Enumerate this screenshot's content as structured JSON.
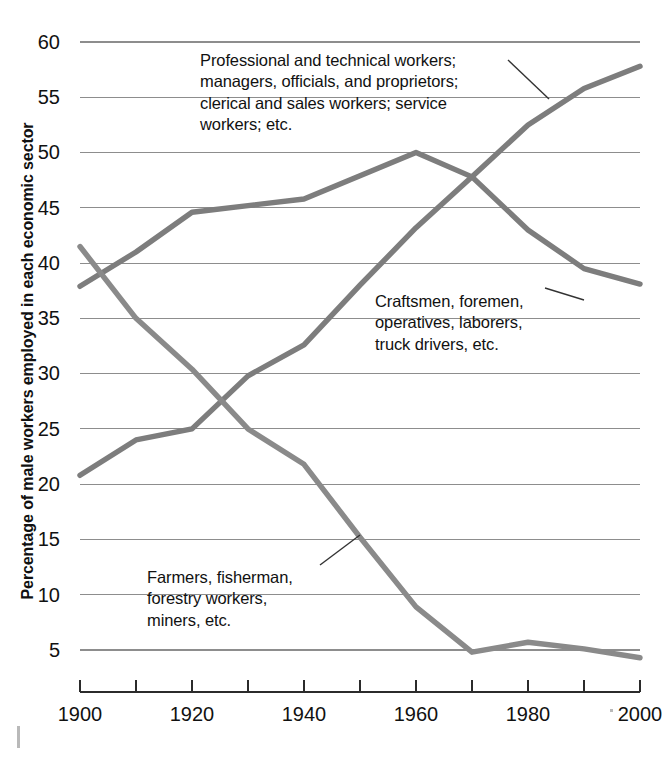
{
  "chart_data": {
    "type": "line",
    "title": "",
    "subtitle": "",
    "xlabel": "",
    "ylabel": "Percentage of male workers employed in each economic sector",
    "xlim": [
      1900,
      2000
    ],
    "ylim": [
      0,
      60
    ],
    "grid": true,
    "legend_position": "inline-annotations",
    "x": [
      1900,
      1910,
      1920,
      1930,
      1940,
      1950,
      1960,
      1970,
      1980,
      1990,
      2000
    ],
    "x_tick_labels": [
      "1900",
      "1920",
      "1940",
      "1960",
      "1980",
      "2000"
    ],
    "x_tick_values": [
      1900,
      1920,
      1940,
      1960,
      1980,
      2000
    ],
    "x_minor_tick_values": [
      1910,
      1930,
      1950,
      1970,
      1990
    ],
    "y_tick_labels": [
      "60",
      "55",
      "50",
      "45",
      "40",
      "35",
      "30",
      "25",
      "20",
      "15",
      "10",
      "5"
    ],
    "y_tick_values": [
      60,
      55,
      50,
      45,
      40,
      35,
      30,
      25,
      20,
      15,
      10,
      5
    ],
    "series": [
      {
        "name": "Professional and technical workers; managers, officials, and proprietors; clerical and sales workers; service workers; etc.",
        "short_name": "professional",
        "color": "#7d7d7d",
        "values": [
          20.8,
          24.0,
          25.0,
          29.8,
          32.6,
          38.0,
          43.2,
          47.8,
          52.5,
          55.8,
          57.8
        ]
      },
      {
        "name": "Craftsmen, foremen, operatives, laborers, truck drivers, etc.",
        "short_name": "craftsmen",
        "color": "#7d7d7d",
        "values": [
          37.9,
          41.0,
          44.6,
          45.2,
          45.8,
          47.9,
          50.0,
          47.8,
          43.0,
          39.5,
          38.1
        ]
      },
      {
        "name": "Farmers, fisherman, forestry workers, miners, etc.",
        "short_name": "farmers",
        "color": "#8a8a8a",
        "values": [
          41.5,
          35.0,
          30.4,
          25.0,
          21.8,
          15.2,
          8.9,
          4.8,
          5.7,
          5.1,
          4.3
        ]
      }
    ],
    "annotations": [
      {
        "id": "professional",
        "text": "Professional and technical workers;\nmanagers, officials, and proprietors;\nclerical and sales workers; service\nworkers; etc.",
        "leader_from": [
          508,
          60
        ],
        "leader_to": [
          549,
          99
        ]
      },
      {
        "id": "craftsmen",
        "text": "Craftsmen, foremen,\noperatives, laborers,\ntruck drivers, etc.",
        "leader_from": [
          545,
          288
        ],
        "leader_to": [
          584,
          300
        ]
      },
      {
        "id": "farmers",
        "text": "Farmers, fisherman,\nforestry workers,\nminers, etc.",
        "leader_from": [
          320,
          565
        ],
        "leader_to": [
          360,
          535
        ]
      }
    ]
  },
  "axes": {
    "y_title": "Percentage of male workers employed in each economic sector",
    "y_labels": [
      "60",
      "55",
      "50",
      "45",
      "40",
      "35",
      "30",
      "25",
      "20",
      "15",
      "10",
      "5"
    ],
    "x_labels": [
      "1900",
      "1920",
      "1940",
      "1960",
      "1980",
      "2000"
    ]
  },
  "colors": {
    "line": "#7d7d7d",
    "line_light": "#8a8a8a",
    "gridline": "#8d8d8d",
    "axis": "#2b2b2b",
    "text": "#111111",
    "background": "#ffffff"
  }
}
